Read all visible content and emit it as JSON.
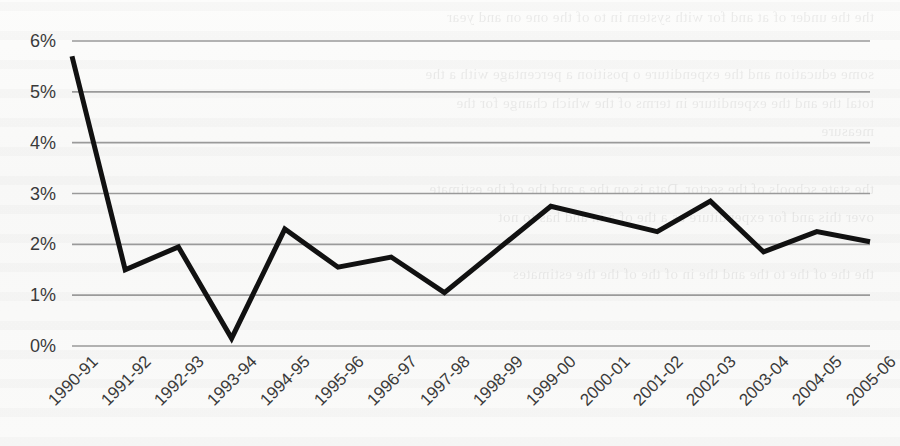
{
  "chart_data": {
    "type": "line",
    "title": "",
    "subtitle": "",
    "xlabel": "",
    "ylabel": "",
    "categories": [
      "1990-91",
      "1991-92",
      "1992-93",
      "1993-94",
      "1994-95",
      "1995-96",
      "1996-97",
      "1997-98",
      "1998-99",
      "1999-00",
      "2000-01",
      "2001-02",
      "2002-03",
      "2003-04",
      "2004-05",
      "2005-06"
    ],
    "values": [
      5.7,
      1.5,
      1.95,
      0.15,
      2.3,
      1.55,
      1.75,
      1.05,
      1.9,
      2.75,
      2.5,
      2.25,
      2.85,
      1.85,
      2.25,
      2.05
    ],
    "series": [
      {
        "name": "",
        "values": [
          5.7,
          1.5,
          1.95,
          0.15,
          2.3,
          1.55,
          1.75,
          1.05,
          1.9,
          2.75,
          2.5,
          2.25,
          2.85,
          1.85,
          2.25,
          2.05
        ],
        "color": "#111111"
      }
    ],
    "ylim": [
      0,
      6
    ],
    "ytick_labels": [
      "0%",
      "1%",
      "2%",
      "3%",
      "4%",
      "5%",
      "6%"
    ],
    "ytick_values": [
      0,
      1,
      2,
      3,
      4,
      5,
      6
    ],
    "grid": true,
    "grid_axis": "y",
    "grid_color": "#9a9a9a",
    "legend": false,
    "legend_position": "none",
    "axis_line": false,
    "line_width": 5,
    "markers": false,
    "xtick_rotation": -45,
    "background_color": "#fbfbfa"
  },
  "page": {
    "bleed_text": "the the under of at and for with system in to of the one on and year\n\nsome education and the expenditure o position a percentage with a the\ntotal the and the expenditure in terms of the which change for the\nmeasure\n\nthe state schools of the sector. Data is on the a and the of the estimate\nover this and for expenditure as a the of a in and has to not\n\nthe the of the to the and the in of the of the the estimates\n"
  }
}
